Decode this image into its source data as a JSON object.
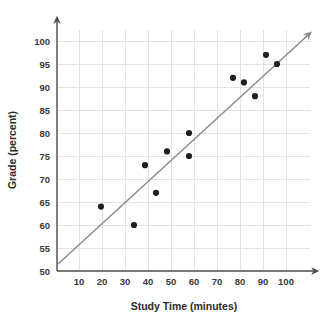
{
  "chart_data": {
    "type": "scatter",
    "title": "",
    "xlabel": "Study Time (minutes)",
    "ylabel": "Grade (percent)",
    "xlim": [
      0,
      110
    ],
    "ylim": [
      50,
      103
    ],
    "grid": true,
    "legend_position": "none",
    "x_ticks": [
      10,
      20,
      30,
      40,
      50,
      60,
      70,
      80,
      90,
      100
    ],
    "y_ticks": [
      50,
      55,
      60,
      65,
      70,
      75,
      80,
      85,
      90,
      95,
      100
    ],
    "x_tick_labels": [
      "10",
      "20",
      "30",
      "40",
      "50",
      "60",
      "70",
      "80",
      "90",
      "100"
    ],
    "y_tick_labels": [
      "50",
      "55",
      "60",
      "65",
      "70",
      "75",
      "80",
      "85",
      "90",
      "95",
      "100"
    ],
    "series": [
      {
        "name": "Students",
        "marker": "filled-circle",
        "color": "#1f1f1f",
        "points": [
          {
            "x": 20,
            "y": 64
          },
          {
            "x": 35,
            "y": 60
          },
          {
            "x": 40,
            "y": 73
          },
          {
            "x": 45,
            "y": 67
          },
          {
            "x": 50,
            "y": 76
          },
          {
            "x": 60,
            "y": 80
          },
          {
            "x": 60,
            "y": 75
          },
          {
            "x": 80,
            "y": 92
          },
          {
            "x": 85,
            "y": 91
          },
          {
            "x": 90,
            "y": 88
          },
          {
            "x": 95,
            "y": 97
          },
          {
            "x": 100,
            "y": 95
          }
        ]
      }
    ],
    "trend_line": {
      "name": "line of best fit",
      "color": "#8a8a8a",
      "arrow_end": true,
      "start": {
        "x": 0,
        "y": 51.5
      },
      "end": {
        "x": 108,
        "y": 103
      }
    },
    "axis_arrows": {
      "x_axis": "arrow-right",
      "y_axis": "arrow-up"
    }
  },
  "icons": {
    "y_axis_arrow": "arrow-up-icon",
    "x_axis_arrow": "arrow-right-icon",
    "trend_arrow": "arrow-up-right-icon"
  }
}
